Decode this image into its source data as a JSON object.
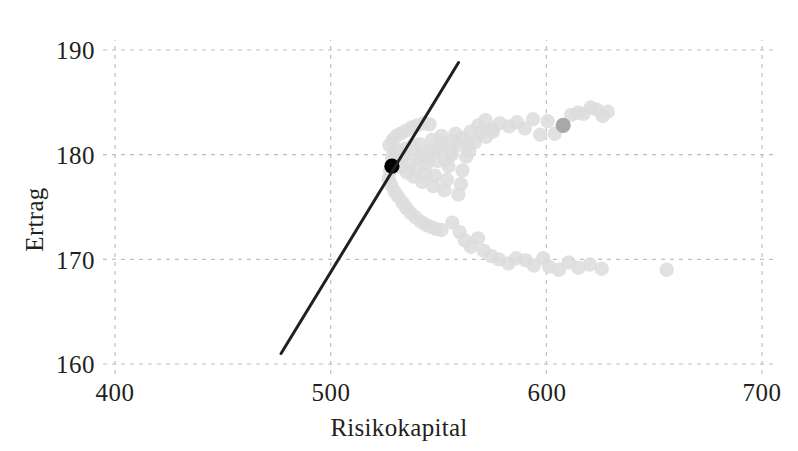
{
  "chart_data": {
    "type": "scatter",
    "title": "",
    "xlabel": "Risikokapital",
    "ylabel": "Ertrag",
    "xlim": [
      400,
      700
    ],
    "ylim": [
      160,
      190
    ],
    "xticks": [
      400,
      500,
      600,
      700
    ],
    "yticks": [
      160,
      170,
      180,
      190
    ],
    "grid": true,
    "grid_style": "dashed",
    "grid_color": "#bfbfbf",
    "legend": "none",
    "background_color": "#ffffff",
    "series": [
      {
        "name": "portfolios",
        "marker": "circle",
        "color": "#dcdcdc",
        "points": [
          [
            528.5,
            179.6
          ],
          [
            529.2,
            180.1
          ],
          [
            530.8,
            179.3
          ],
          [
            531.5,
            180.4
          ],
          [
            532.9,
            178.8
          ],
          [
            533.6,
            179.9
          ],
          [
            534.8,
            180.6
          ],
          [
            535.4,
            178.3
          ],
          [
            536.7,
            179.2
          ],
          [
            537.9,
            180.8
          ],
          [
            538.5,
            177.9
          ],
          [
            539.8,
            178.6
          ],
          [
            540.6,
            179.7
          ],
          [
            541.3,
            181.0
          ],
          [
            542.5,
            177.4
          ],
          [
            543.8,
            178.2
          ],
          [
            544.4,
            179.1
          ],
          [
            545.7,
            180.3
          ],
          [
            546.9,
            181.4
          ],
          [
            547.6,
            177.0
          ],
          [
            548.3,
            178.0
          ],
          [
            549.5,
            179.4
          ],
          [
            550.8,
            180.7
          ],
          [
            551.4,
            181.8
          ],
          [
            552.7,
            176.6
          ],
          [
            553.9,
            177.6
          ],
          [
            554.6,
            178.9
          ],
          [
            555.8,
            180.2
          ],
          [
            556.5,
            181.3
          ],
          [
            557.9,
            182.0
          ],
          [
            559.2,
            176.2
          ],
          [
            560.4,
            177.2
          ],
          [
            561.1,
            178.5
          ],
          [
            562.8,
            179.8
          ],
          [
            563.5,
            181.0
          ],
          [
            564.9,
            182.2
          ],
          [
            527.6,
            178.4
          ],
          [
            526.9,
            177.7
          ],
          [
            528.1,
            177.1
          ],
          [
            529.6,
            176.5
          ],
          [
            531.2,
            176.0
          ],
          [
            533.4,
            175.4
          ],
          [
            535.1,
            174.9
          ],
          [
            537.2,
            174.4
          ],
          [
            539.4,
            174.0
          ],
          [
            541.8,
            173.6
          ],
          [
            544.2,
            173.3
          ],
          [
            546.5,
            173.1
          ],
          [
            548.9,
            172.9
          ],
          [
            551.4,
            172.8
          ],
          [
            527.3,
            180.9
          ],
          [
            528.8,
            181.4
          ],
          [
            530.5,
            181.8
          ],
          [
            532.4,
            182.0
          ],
          [
            534.9,
            182.3
          ],
          [
            537.6,
            182.6
          ],
          [
            540.2,
            182.8
          ],
          [
            543.0,
            183.0
          ],
          [
            545.8,
            182.9
          ],
          [
            542.1,
            180.0
          ],
          [
            545.0,
            179.6
          ],
          [
            548.2,
            180.4
          ],
          [
            550.9,
            181.1
          ],
          [
            553.2,
            179.5
          ],
          [
            556.1,
            180.0
          ],
          [
            558.8,
            180.9
          ],
          [
            561.5,
            181.6
          ],
          [
            564.2,
            180.3
          ],
          [
            566.8,
            181.2
          ],
          [
            569.4,
            182.1
          ],
          [
            572.0,
            181.7
          ],
          [
            574.6,
            182.4
          ],
          [
            556.4,
            173.5
          ],
          [
            559.8,
            172.6
          ],
          [
            562.2,
            171.8
          ],
          [
            565.0,
            171.2
          ],
          [
            568.3,
            172.0
          ],
          [
            571.1,
            170.8
          ],
          [
            574.5,
            170.3
          ],
          [
            578.0,
            170.0
          ],
          [
            582.4,
            169.6
          ],
          [
            586.1,
            170.1
          ],
          [
            590.5,
            169.9
          ],
          [
            594.2,
            169.4
          ],
          [
            598.6,
            170.1
          ],
          [
            601.3,
            169.3
          ],
          [
            605.8,
            169.0
          ],
          [
            610.4,
            169.7
          ],
          [
            614.9,
            169.2
          ],
          [
            620.2,
            169.5
          ],
          [
            625.7,
            169.1
          ],
          [
            655.8,
            169.0
          ],
          [
            582.8,
            182.7
          ],
          [
            586.4,
            183.1
          ],
          [
            590.0,
            182.5
          ],
          [
            593.8,
            183.4
          ],
          [
            597.2,
            181.9
          ],
          [
            600.6,
            183.2
          ],
          [
            603.9,
            182.0
          ],
          [
            611.5,
            183.8
          ],
          [
            614.8,
            184.0
          ],
          [
            617.2,
            183.9
          ],
          [
            620.6,
            184.5
          ],
          [
            623.4,
            184.3
          ],
          [
            626.1,
            183.7
          ],
          [
            628.5,
            184.1
          ],
          [
            578.5,
            183.0
          ],
          [
            575.2,
            182.2
          ],
          [
            571.8,
            183.3
          ],
          [
            568.5,
            182.8
          ]
        ]
      },
      {
        "name": "highlighted-light-gray",
        "marker": "circle",
        "color": "#a8a8a8",
        "points": [
          [
            607.8,
            182.8
          ]
        ]
      },
      {
        "name": "highlighted-black",
        "marker": "circle",
        "color": "#000000",
        "points": [
          [
            528.4,
            178.9
          ]
        ]
      }
    ],
    "line": {
      "name": "capital-market-line",
      "color": "#231f20",
      "width": 3,
      "from": [
        477.0,
        161.0
      ],
      "to": [
        559.3,
        188.8
      ]
    }
  }
}
